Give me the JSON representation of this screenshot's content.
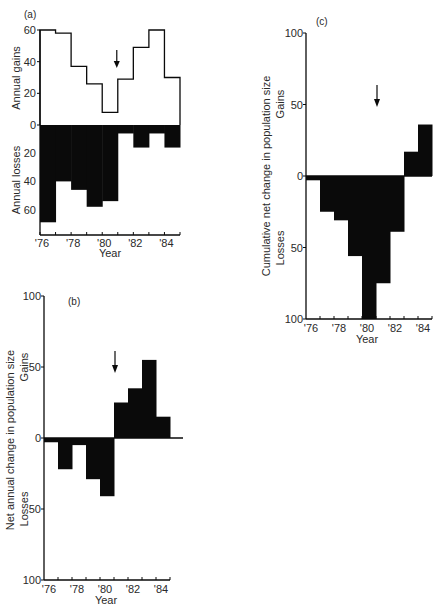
{
  "chart_data": [
    {
      "id": "a",
      "type": "bar",
      "panel_label": "(a)",
      "categories": [
        "'76",
        "'77",
        "'78",
        "'79",
        "'80",
        "'81",
        "'82",
        "'83",
        "'84"
      ],
      "tick_labels": [
        "'76",
        "'78",
        "'80",
        "'82",
        "'84"
      ],
      "xlabel": "Year",
      "upper": {
        "ylabel": "Annual gains",
        "ylim": [
          0,
          60
        ],
        "yticks": [
          0,
          20,
          40,
          60
        ],
        "style": "outline-step",
        "values": [
          60,
          58,
          37,
          26,
          8,
          29,
          49,
          60,
          30
        ]
      },
      "lower": {
        "ylabel": "Annual losses",
        "ylim": [
          0,
          70
        ],
        "yticks": [
          20,
          40,
          60
        ],
        "style": "filled",
        "values": [
          69,
          40,
          46,
          58,
          54,
          6,
          16,
          6,
          16
        ]
      },
      "annotation": {
        "type": "arrow",
        "text": "",
        "at_category": "'80/'81 boundary"
      }
    },
    {
      "id": "b",
      "type": "bar",
      "panel_label": "(b)",
      "categories": [
        "'76",
        "'77",
        "'78",
        "'79",
        "'80",
        "'81",
        "'82",
        "'83",
        "'84"
      ],
      "tick_labels": [
        "'76",
        "'78",
        "'80",
        "'82",
        "'84"
      ],
      "xlabel": "Year",
      "ylabel": "Net annual change in population size",
      "ylabel_gains": "Gains",
      "ylabel_losses": "Losses",
      "ylim": [
        -100,
        100
      ],
      "yticks": [
        "100",
        "50",
        "0",
        "50",
        "100"
      ],
      "values": [
        -3,
        -22,
        -5,
        -29,
        -41,
        25,
        35,
        55,
        15
      ],
      "annotation": {
        "type": "arrow",
        "text": "",
        "at_category": "'80/'81 boundary"
      }
    },
    {
      "id": "c",
      "type": "bar",
      "panel_label": "(c)",
      "categories": [
        "'76",
        "'77",
        "'78",
        "'79",
        "'80",
        "'81",
        "'82",
        "'83",
        "'84"
      ],
      "tick_labels": [
        "'76",
        "'78",
        "'80",
        "'82",
        "'84"
      ],
      "xlabel": "Year",
      "ylabel": "Cumulative net change in population size",
      "ylabel_gains": "Gains",
      "ylabel_losses": "Losses",
      "ylim": [
        -100,
        100
      ],
      "yticks": [
        "100",
        "50",
        "0",
        "50",
        "100"
      ],
      "values": [
        -3,
        -25,
        -31,
        -56,
        -100,
        -75,
        -39,
        17,
        36
      ],
      "annotation": {
        "type": "arrow",
        "text": "",
        "at_category": "'80/'81 boundary"
      }
    }
  ]
}
